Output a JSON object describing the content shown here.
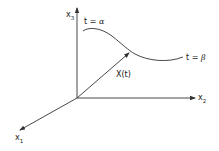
{
  "diagram": {
    "axes": {
      "x1": {
        "base": "x",
        "sub": "1"
      },
      "x2": {
        "base": "x",
        "sub": "2"
      },
      "x3": {
        "base": "x",
        "sub": "3"
      }
    },
    "curve": {
      "start_label": {
        "prefix": "t = ",
        "symbol": "α"
      },
      "end_label": {
        "prefix": "t = ",
        "symbol": "β"
      }
    },
    "vector": {
      "label": "X(t)"
    },
    "colors": {
      "line": "#333333",
      "background": "#ffffff"
    }
  }
}
